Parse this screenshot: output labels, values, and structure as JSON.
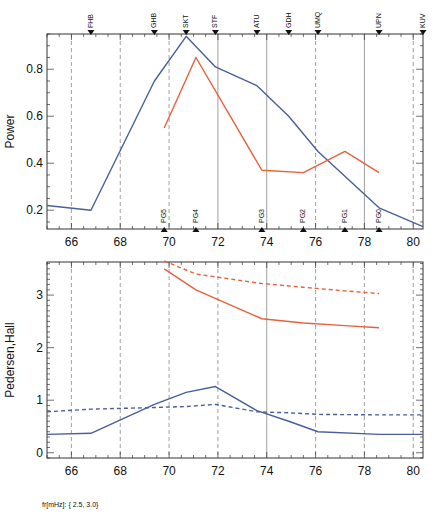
{
  "chart_data": [
    {
      "type": "line",
      "title": "",
      "xlabel": "",
      "ylabel": "Power",
      "xlim": [
        65,
        80.4
      ],
      "ylim": [
        0.12,
        0.95
      ],
      "x_ticks": [
        66,
        68,
        70,
        72,
        74,
        76,
        78,
        80
      ],
      "y_ticks": [
        0.2,
        0.4,
        0.6,
        0.8
      ],
      "top_markers": [
        {
          "label": "FHB",
          "x": 66.8
        },
        {
          "label": "GHB",
          "x": 69.4
        },
        {
          "label": "SKT",
          "x": 70.7
        },
        {
          "label": "STF",
          "x": 71.9
        },
        {
          "label": "ATU",
          "x": 73.6
        },
        {
          "label": "GDH",
          "x": 74.9
        },
        {
          "label": "UMQ",
          "x": 76.1
        },
        {
          "label": "UPN",
          "x": 78.6
        },
        {
          "label": "KUV",
          "x": 80.4
        }
      ],
      "bottom_markers": [
        {
          "label": "PG5",
          "x": 69.8
        },
        {
          "label": "PG4",
          "x": 71.1
        },
        {
          "label": "PG3",
          "x": 73.8
        },
        {
          "label": "PG2",
          "x": 75.5
        },
        {
          "label": "PG1",
          "x": 77.2
        },
        {
          "label": "PG0",
          "x": 78.6
        }
      ],
      "vertical_lines_dashed": [
        66,
        68,
        70,
        76,
        80
      ],
      "vertical_lines_solid": [
        72,
        74,
        78
      ],
      "series": [
        {
          "name": "station power",
          "color": "#4a5f9a",
          "style": "solid",
          "x": [
            65,
            66.8,
            69.4,
            70.7,
            71.9,
            73.6,
            74.9,
            76.1,
            78.6,
            80.4
          ],
          "y": [
            0.22,
            0.2,
            0.75,
            0.94,
            0.81,
            0.73,
            0.6,
            0.45,
            0.21,
            0.13
          ]
        },
        {
          "name": "PG power",
          "color": "#e8603c",
          "style": "solid",
          "x": [
            69.8,
            71.1,
            73.8,
            75.5,
            77.2,
            78.6
          ],
          "y": [
            0.55,
            0.85,
            0.37,
            0.36,
            0.45,
            0.36
          ]
        }
      ]
    },
    {
      "type": "line",
      "title": "",
      "xlabel": "",
      "ylabel": "Pedersen,Hall",
      "xlim": [
        65,
        80.4
      ],
      "ylim": [
        -0.1,
        3.63
      ],
      "x_ticks": [
        66,
        68,
        70,
        72,
        74,
        76,
        78,
        80
      ],
      "y_ticks": [
        0,
        1,
        2,
        3
      ],
      "vertical_lines_dashed": [
        66,
        68,
        70,
        72,
        76,
        78,
        80
      ],
      "vertical_lines_solid": [
        74
      ],
      "series": [
        {
          "name": "station Pedersen",
          "color": "#4a5f9a",
          "style": "solid",
          "x": [
            65,
            66.8,
            69.4,
            70.7,
            71.9,
            73.6,
            74.9,
            76.1,
            78.6,
            80.4
          ],
          "y": [
            0.35,
            0.37,
            0.92,
            1.15,
            1.26,
            0.8,
            0.6,
            0.4,
            0.35,
            0.35
          ]
        },
        {
          "name": "station Hall",
          "color": "#4a5f9a",
          "style": "dashed",
          "x": [
            65,
            66.8,
            69.4,
            70.7,
            71.9,
            73.6,
            74.9,
            76.1,
            78.6,
            80.4
          ],
          "y": [
            0.78,
            0.83,
            0.86,
            0.88,
            0.92,
            0.78,
            0.76,
            0.73,
            0.72,
            0.72
          ]
        },
        {
          "name": "PG Pedersen",
          "color": "#e8603c",
          "style": "solid",
          "x": [
            69.8,
            71.1,
            73.8,
            75.5,
            77.2,
            78.6
          ],
          "y": [
            3.5,
            3.1,
            2.55,
            2.47,
            2.42,
            2.38
          ]
        },
        {
          "name": "PG Hall",
          "color": "#e8603c",
          "style": "dashed",
          "x": [
            69.8,
            71.1,
            73.8,
            75.5,
            77.2,
            78.6
          ],
          "y": [
            3.65,
            3.4,
            3.22,
            3.15,
            3.08,
            3.03
          ]
        }
      ]
    }
  ],
  "footer": {
    "label": "fr[mHz]: { 2.5, 3.0}"
  },
  "colors": {
    "blue": "#4a5f9a",
    "orange": "#e8603c",
    "grid": "#888888"
  }
}
